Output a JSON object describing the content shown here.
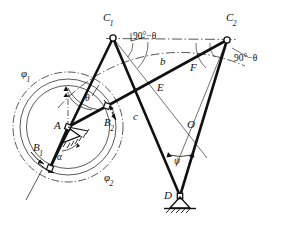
{
  "figure": {
    "type": "engineering-line-diagram",
    "canvas": {
      "width": 286,
      "height": 228
    },
    "background_color": "#ffffff",
    "line_color": "#111111"
  },
  "labels": {
    "c1": "C",
    "c1_sub": "1",
    "c2": "C",
    "c2_sub": "2",
    "b1": "B",
    "b1_sub": "1",
    "b2": "B",
    "b2_sub": "2",
    "a": "A",
    "d": "D",
    "o": "O",
    "e": "E",
    "f": "F",
    "b_link": "b",
    "c_link": "c",
    "theta": "θ",
    "alpha": "α",
    "psi": "ψ",
    "phi1": "φ",
    "phi1_sub": "1",
    "phi2": "φ",
    "phi2_sub": "2",
    "angle_left": "90°−θ",
    "angle_right": "90°−θ"
  },
  "points": {
    "A": {
      "x": 68,
      "y": 127,
      "kind": "fixed-pivot"
    },
    "B1": {
      "x": 50,
      "y": 168,
      "kind": "moving-pivot"
    },
    "B2": {
      "x": 107,
      "y": 106,
      "kind": "moving-pivot"
    },
    "C1": {
      "x": 113,
      "y": 38,
      "kind": "moving-pivot"
    },
    "C2": {
      "x": 227,
      "y": 40,
      "kind": "moving-pivot"
    },
    "D": {
      "x": 180,
      "y": 196,
      "kind": "fixed-pivot"
    },
    "O": {
      "x": 194,
      "y": 136,
      "kind": "intersection"
    }
  },
  "links": [
    {
      "name": "A-B1",
      "from": "A",
      "to": "B1",
      "weight": "thick"
    },
    {
      "name": "A-B2",
      "from": "A",
      "to": "B2",
      "weight": "thick"
    },
    {
      "name": "B1-C1",
      "from": "B1",
      "to": "C1",
      "weight": "thick"
    },
    {
      "name": "B2-C2",
      "from": "B2",
      "to": "C2",
      "weight": "thick"
    },
    {
      "name": "C1-D",
      "from": "C1",
      "to": "D",
      "weight": "thick"
    },
    {
      "name": "C2-D",
      "from": "C2",
      "to": "D",
      "weight": "thick"
    }
  ],
  "construction_lines": [
    {
      "name": "C1-C2-chord",
      "style": "dash-dot"
    },
    {
      "name": "C1-toward-O",
      "style": "thin"
    },
    {
      "name": "C2-toward-O",
      "style": "thin"
    },
    {
      "name": "arc-through-C1-C2",
      "style": "dash-dot"
    },
    {
      "name": "circle-phi1",
      "style": "thin"
    },
    {
      "name": "circle-phi2",
      "style": "dash-dot"
    }
  ],
  "angles": {
    "at_C1": "90°−θ",
    "at_C2": "90°−θ",
    "at_A_theta": "θ",
    "at_A_alpha": "α",
    "at_D_psi": "ψ"
  },
  "link_names": {
    "b": "b",
    "c": "c",
    "E": "E",
    "F": "F",
    "O": "O"
  },
  "rotation_arrows": {
    "phi1": "φ₁",
    "phi2": "φ₂"
  }
}
